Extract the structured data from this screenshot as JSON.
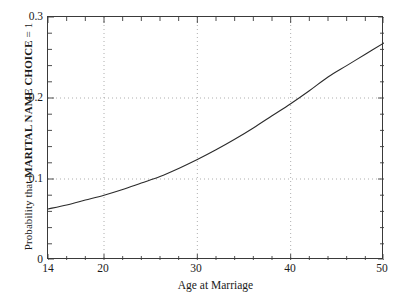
{
  "chart_data": {
    "type": "line",
    "title": "",
    "xlabel": "Age at Marriage",
    "ylabel_prefix": "Probability that ",
    "ylabel_bold": "MARITAL NAME CHOICE",
    "ylabel_suffix": " = 1",
    "ylabel_full": "Probability that MARITAL NAME CHOICE = 1",
    "xlim": [
      14,
      50
    ],
    "ylim": [
      0,
      0.3
    ],
    "xticks": [
      14,
      20,
      30,
      40,
      50
    ],
    "xtick_labels": [
      "14",
      "20",
      "30",
      "40",
      "50"
    ],
    "yticks": [
      0,
      0.1,
      0.2,
      0.3
    ],
    "ytick_labels": [
      "0",
      "0.1",
      "0.2",
      "0.3"
    ],
    "x_minor_tick_step": 2,
    "y_minor_tick_step": 0.02,
    "grid": "dotted gridlines at major x (20, 30, 40) and major y (0.1, 0.2)",
    "grid_color": "#9a9a9a",
    "line_color": "#2b2b2b",
    "axis_color": "#3a3a3a",
    "legend": "none",
    "series": [
      {
        "name": "Predicted probability",
        "x": [
          14,
          16,
          18,
          20,
          22,
          24,
          26,
          28,
          30,
          32,
          34,
          36,
          38,
          40,
          42,
          44,
          46,
          48,
          50
        ],
        "values": [
          0.063,
          0.068,
          0.074,
          0.08,
          0.087,
          0.095,
          0.103,
          0.113,
          0.124,
          0.136,
          0.149,
          0.163,
          0.178,
          0.193,
          0.209,
          0.226,
          0.24,
          0.254,
          0.268
        ]
      }
    ]
  }
}
